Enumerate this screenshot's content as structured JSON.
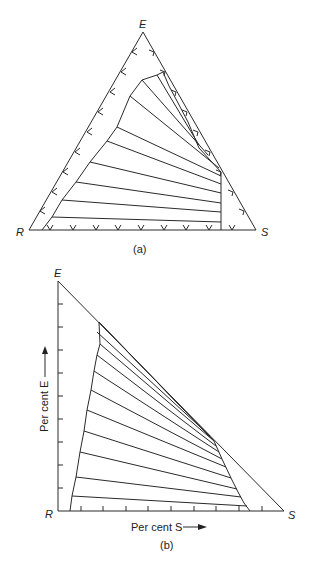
{
  "diagram_a": {
    "caption": "(a)",
    "vertices": {
      "top": "E",
      "left": "R",
      "right": "S"
    },
    "type": "ternary triangular diagram with tie lines"
  },
  "diagram_b": {
    "caption": "(b)",
    "vertices": {
      "top": "E",
      "left": "R",
      "right": "S"
    },
    "y_axis_label": "Per cent E",
    "x_axis_label": "Per cent S",
    "type": "right-angled triangular diagram with tie lines"
  }
}
